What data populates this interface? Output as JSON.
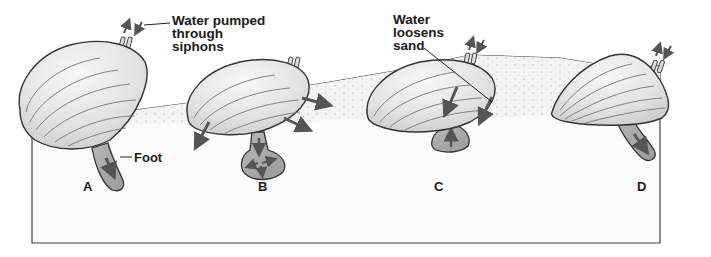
{
  "diagram": {
    "colors": {
      "background": "#ffffff",
      "sand_surface": "#f2f2f2",
      "sediment_box_fill": "#fafafa",
      "shell_fill": "#e6e6e6",
      "shell_lines": "#6a6a6a",
      "foot_fill": "#a8a8a8",
      "arrow": "#555555",
      "outline": "#333333"
    },
    "callouts": {
      "siphons": [
        "Water pumped",
        "through",
        "siphons"
      ],
      "loosens": [
        "Water",
        "loosens",
        "sand"
      ],
      "foot": "Foot"
    },
    "stages": [
      {
        "id": "A",
        "label": "A",
        "description": "Foot extends down into sand; water pumped through siphons"
      },
      {
        "id": "B",
        "label": "B",
        "description": "Foot tip swells to anchor; water jets out from shell edges"
      },
      {
        "id": "C",
        "label": "C",
        "description": "Shell pulled down toward anchored foot; water loosens sand"
      },
      {
        "id": "D",
        "label": "D",
        "description": "Clam buried in sand; foot extends again"
      }
    ]
  }
}
